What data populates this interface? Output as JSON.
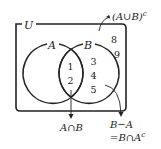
{
  "diagram": {
    "type": "venn",
    "universe_label": "U",
    "sets": [
      {
        "name": "A",
        "label": "A"
      },
      {
        "name": "B",
        "label": "B"
      }
    ],
    "regions": {
      "A_only": [],
      "A_and_B": [
        "1",
        "2"
      ],
      "B_only": [
        "3",
        "4",
        "5"
      ],
      "outside": [
        "8",
        "9"
      ]
    },
    "annotations": {
      "complement_union": {
        "base": "(A∪B)",
        "sup": "c"
      },
      "intersection": "A∩B",
      "difference_line1": "B−A",
      "difference_line2": {
        "base": "=B∩A",
        "sup": "c"
      }
    },
    "colors": {
      "stroke": "#222222",
      "background": "#ffffff"
    }
  }
}
